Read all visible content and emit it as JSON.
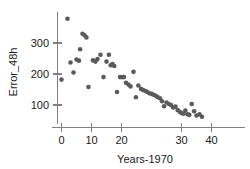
{
  "chart_data": {
    "type": "scatter",
    "title": "",
    "xlabel": "Years-1970",
    "ylabel": "Error_48h",
    "xlim": [
      -1.5,
      47.5
    ],
    "ylim": [
      40,
      395
    ],
    "xticks": [
      0,
      10,
      20,
      30,
      40
    ],
    "yticks": [
      100,
      200,
      300
    ],
    "xtick_labels": [
      "0",
      "10",
      "20",
      "30",
      "40"
    ],
    "ytick_labels": [
      "100",
      "200",
      "300"
    ],
    "grid": false,
    "legend": null,
    "marker": "filled-circle",
    "marker_color": "#5a5a5a",
    "axis_color": "#808080",
    "points": [
      {
        "x": 0,
        "y": 182
      },
      {
        "x": 2,
        "y": 378
      },
      {
        "x": 3,
        "y": 237
      },
      {
        "x": 4,
        "y": 205
      },
      {
        "x": 5,
        "y": 247
      },
      {
        "x": 5.8,
        "y": 243
      },
      {
        "x": 6.2,
        "y": 280
      },
      {
        "x": 7,
        "y": 330
      },
      {
        "x": 7.7,
        "y": 325
      },
      {
        "x": 8.3,
        "y": 318
      },
      {
        "x": 9,
        "y": 158
      },
      {
        "x": 10.5,
        "y": 244
      },
      {
        "x": 11.3,
        "y": 240
      },
      {
        "x": 12,
        "y": 248
      },
      {
        "x": 13,
        "y": 262
      },
      {
        "x": 14,
        "y": 190
      },
      {
        "x": 15,
        "y": 240
      },
      {
        "x": 15.8,
        "y": 262
      },
      {
        "x": 16.4,
        "y": 228
      },
      {
        "x": 17,
        "y": 232
      },
      {
        "x": 17.6,
        "y": 226
      },
      {
        "x": 18.5,
        "y": 142
      },
      {
        "x": 19.5,
        "y": 190
      },
      {
        "x": 20.2,
        "y": 190
      },
      {
        "x": 20.8,
        "y": 190
      },
      {
        "x": 21.5,
        "y": 172
      },
      {
        "x": 22.3,
        "y": 166
      },
      {
        "x": 23,
        "y": 160
      },
      {
        "x": 24,
        "y": 207
      },
      {
        "x": 24.8,
        "y": 125
      },
      {
        "x": 25.6,
        "y": 163
      },
      {
        "x": 26.5,
        "y": 152
      },
      {
        "x": 27.2,
        "y": 148
      },
      {
        "x": 28,
        "y": 145
      },
      {
        "x": 28.6,
        "y": 142
      },
      {
        "x": 29.3,
        "y": 138
      },
      {
        "x": 30,
        "y": 136
      },
      {
        "x": 30.7,
        "y": 133
      },
      {
        "x": 31.4,
        "y": 130
      },
      {
        "x": 32,
        "y": 126
      },
      {
        "x": 32.8,
        "y": 122
      },
      {
        "x": 33.5,
        "y": 112
      },
      {
        "x": 34.2,
        "y": 96
      },
      {
        "x": 35,
        "y": 108
      },
      {
        "x": 35.8,
        "y": 103
      },
      {
        "x": 36.5,
        "y": 100
      },
      {
        "x": 37.2,
        "y": 92
      },
      {
        "x": 38,
        "y": 95
      },
      {
        "x": 38.7,
        "y": 84
      },
      {
        "x": 39.4,
        "y": 78
      },
      {
        "x": 40,
        "y": 74
      },
      {
        "x": 40.6,
        "y": 72
      },
      {
        "x": 41.3,
        "y": 82
      },
      {
        "x": 42,
        "y": 70
      },
      {
        "x": 42.6,
        "y": 68
      },
      {
        "x": 43.4,
        "y": 103
      },
      {
        "x": 44.2,
        "y": 80
      },
      {
        "x": 45,
        "y": 66
      },
      {
        "x": 46,
        "y": 70
      },
      {
        "x": 46.8,
        "y": 62
      }
    ]
  }
}
